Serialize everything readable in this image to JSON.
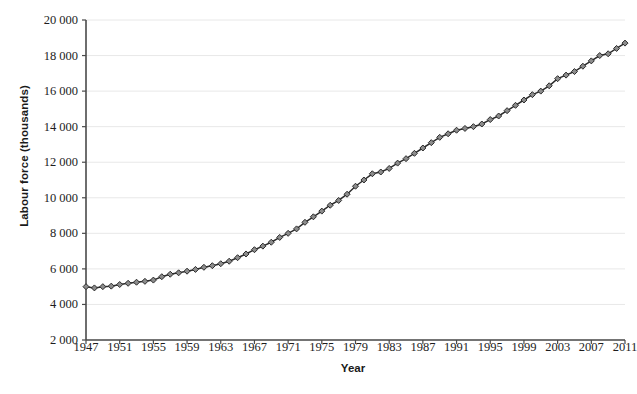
{
  "chart_data": {
    "type": "line",
    "title": "",
    "xlabel": "Year",
    "ylabel": "Labour force (thousands)",
    "xlim": [
      1947,
      2011
    ],
    "ylim": [
      2000,
      20000
    ],
    "ytick_step": 2000,
    "xtick_step": 4,
    "grid": true,
    "legend_position": "none",
    "marker": "diamond",
    "line_color": "#2b2b2b",
    "marker_fill": "#8c8c8c",
    "marker_edge": "#2b2b2b",
    "grid_color": "#e8e8e8",
    "axis_color": "#4a4a4a",
    "ytick_labels": [
      "2 000",
      "4 000",
      "6 000",
      "8 000",
      "10 000",
      "12 000",
      "14 000",
      "16 000",
      "18 000",
      "20 000"
    ],
    "ytick_values": [
      2000,
      4000,
      6000,
      8000,
      10000,
      12000,
      14000,
      16000,
      18000,
      20000
    ],
    "xtick_labels": [
      "1947",
      "1951",
      "1955",
      "1959",
      "1963",
      "1967",
      "1971",
      "1975",
      "1979",
      "1983",
      "1987",
      "1991",
      "1995",
      "1999",
      "2003",
      "2007",
      "2011"
    ],
    "xtick_values": [
      1947,
      1951,
      1955,
      1959,
      1963,
      1967,
      1971,
      1975,
      1979,
      1983,
      1987,
      1991,
      1995,
      1999,
      2003,
      2007,
      2011
    ],
    "x": [
      1947,
      1948,
      1949,
      1950,
      1951,
      1952,
      1953,
      1954,
      1955,
      1956,
      1957,
      1958,
      1959,
      1960,
      1961,
      1962,
      1963,
      1964,
      1965,
      1966,
      1967,
      1968,
      1969,
      1970,
      1971,
      1972,
      1973,
      1974,
      1975,
      1976,
      1977,
      1978,
      1979,
      1980,
      1981,
      1982,
      1983,
      1984,
      1985,
      1986,
      1987,
      1988,
      1989,
      1990,
      1991,
      1992,
      1993,
      1994,
      1995,
      1996,
      1997,
      1998,
      1999,
      2000,
      2001,
      2002,
      2003,
      2004,
      2005,
      2006,
      2007,
      2008,
      2009,
      2010,
      2011
    ],
    "series": [
      {
        "name": "Labour force",
        "values": [
          5000,
          4930,
          5000,
          5030,
          5120,
          5190,
          5250,
          5300,
          5370,
          5560,
          5700,
          5780,
          5870,
          5970,
          6090,
          6180,
          6290,
          6430,
          6630,
          6840,
          7080,
          7280,
          7500,
          7770,
          8000,
          8250,
          8620,
          8930,
          9250,
          9580,
          9850,
          10200,
          10650,
          11000,
          11350,
          11450,
          11650,
          11950,
          12200,
          12500,
          12800,
          13100,
          13400,
          13600,
          13800,
          13900,
          14000,
          14150,
          14400,
          14600,
          14900,
          15200,
          15500,
          15800,
          16000,
          16300,
          16700,
          16900,
          17100,
          17400,
          17700,
          18000,
          18100,
          18400,
          18700
        ]
      }
    ]
  },
  "footer_bleed": "scanned page bleed-through"
}
